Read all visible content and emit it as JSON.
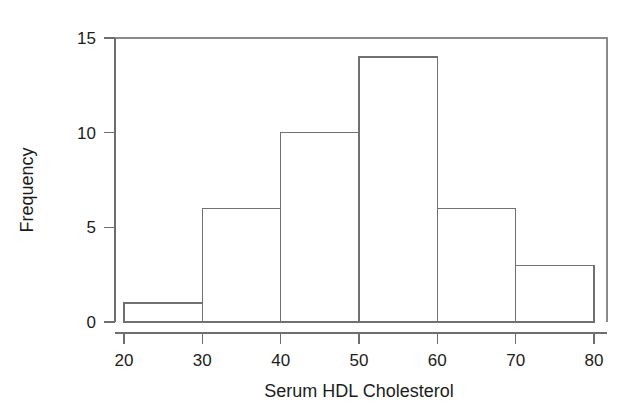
{
  "chart_data": {
    "type": "bar",
    "chart_subtype": "histogram",
    "title": "",
    "xlabel": "Serum HDL Cholesterol",
    "ylabel": "Frequency",
    "categories": [
      "20-30",
      "30-40",
      "40-50",
      "50-60",
      "60-70",
      "70-80"
    ],
    "bin_edges": [
      20,
      30,
      40,
      50,
      60,
      70,
      80
    ],
    "values": [
      1,
      6,
      10,
      14,
      6,
      3
    ],
    "bin_width": 10,
    "xlim": [
      20,
      80
    ],
    "ylim": [
      0,
      15
    ],
    "xticks": [
      20,
      30,
      40,
      50,
      60,
      70,
      80
    ],
    "xtick_labels": [
      "20",
      "30",
      "40",
      "50",
      "60",
      "70",
      "80"
    ],
    "yticks": [
      0,
      5,
      10,
      15
    ],
    "ytick_labels": [
      "0",
      "5",
      "10",
      "15"
    ],
    "grid": false,
    "legend": false,
    "legend_position": "none",
    "total_count": 40,
    "bar_fill_color": "#ffffff",
    "bar_edge_color": "#707070",
    "axis_color": "#6e6e6e",
    "background_color": "#ffffff",
    "box_frame": true
  },
  "figure": {
    "name": "serum-hdl-cholesterol-histogram"
  }
}
